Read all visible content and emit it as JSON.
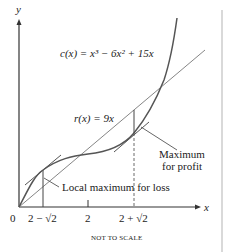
{
  "figure": {
    "axis_x_label": "x",
    "axis_y_label": "y",
    "origin_label": "0",
    "cost_function_label": "c(x) = x³ − 6x² + 15x",
    "revenue_function_label": "r(x) = 9x",
    "annotation_profit_line1": "Maximum",
    "annotation_profit_line2": "for profit",
    "annotation_loss": "Local maximum for loss",
    "tick_labels": [
      "2 − √2",
      "2",
      "2 + √2"
    ],
    "footer_note": "NOT TO SCALE",
    "colors": {
      "axis": "#333333",
      "curve": "#555555",
      "line": "#777777",
      "border": "#cccccc",
      "text": "#222222"
    }
  }
}
